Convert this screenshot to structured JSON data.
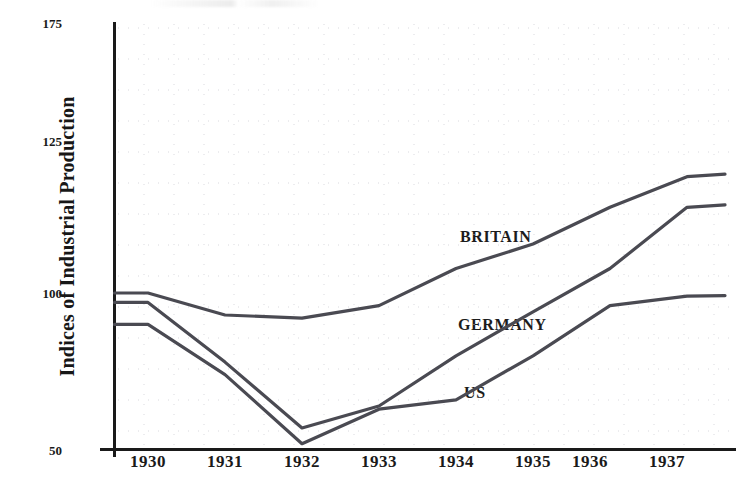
{
  "chart_data": {
    "type": "line",
    "title": "",
    "xlabel": "",
    "ylabel": "Indices of Industrial Production",
    "x": [
      1930,
      1931,
      1932,
      1933,
      1934,
      1935,
      1936,
      1937
    ],
    "x_tick_labels": [
      "1930",
      "1931",
      "1932",
      "1933",
      "1934",
      "1935",
      "1936",
      "1937"
    ],
    "y_tick_labels": [
      "175",
      "125",
      "100",
      "50"
    ],
    "y_tick_values": [
      175,
      125,
      100,
      50
    ],
    "ylim": [
      50,
      175
    ],
    "grid": true,
    "grid_style": "dotted-faint",
    "legend_position": "inline-annotations",
    "line_color": "#4a4a52",
    "series": [
      {
        "name": "BRITAIN",
        "label_position": {
          "x": 460,
          "y": 228
        },
        "values": [
          100,
          93,
          92,
          96,
          104,
          108,
          114,
          119
        ],
        "start_value_1929": 100
      },
      {
        "name": "GERMANY",
        "label_position": {
          "x": 458,
          "y": 316
        },
        "values": [
          97,
          78,
          57,
          64,
          80,
          94,
          104,
          114
        ],
        "start_value_1929": 97
      },
      {
        "name": "US",
        "label_position": {
          "x": 464,
          "y": 384
        },
        "values": [
          90,
          74,
          52,
          63,
          66,
          80,
          96,
          99
        ],
        "start_value_1929": 90
      }
    ],
    "annotations": [
      "BRITAIN",
      "GERMANY",
      "US"
    ]
  },
  "axes": {
    "y_axis_title": "Indices of Industrial Production",
    "y_ticks": [
      {
        "label": "175",
        "value": 175
      },
      {
        "label": "125",
        "value": 125
      },
      {
        "label": "100",
        "value": 100
      },
      {
        "label": "50",
        "value": 50
      }
    ],
    "x_ticks": [
      {
        "label": "1930"
      },
      {
        "label": "1931"
      },
      {
        "label": "1932"
      },
      {
        "label": "1933"
      },
      {
        "label": "1934"
      },
      {
        "label": "1935"
      },
      {
        "label": "1936"
      },
      {
        "label": "1937"
      }
    ]
  },
  "colors": {
    "line": "#4a4a52",
    "axis": "#1a1a1a",
    "grid": "#cfcfd6",
    "text": "#171717",
    "background": "#ffffff"
  }
}
